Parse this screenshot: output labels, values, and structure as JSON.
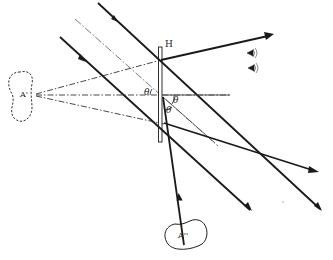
{
  "diagram": {
    "labels": {
      "hologram": "H",
      "virtual_image": "A'",
      "real_image": "A''",
      "angle_1": "θ",
      "angle_2": "θ",
      "angle_3": "θ"
    },
    "elements": [
      {
        "id": "hologram-plate",
        "type": "rect",
        "label": "H"
      },
      {
        "id": "virtual-image-blob",
        "type": "dashed-blob",
        "label": "A'"
      },
      {
        "id": "real-image-blob",
        "type": "solid-blob",
        "label": "A''"
      },
      {
        "id": "reconstruction-beam-upper",
        "type": "thick-arrow-line"
      },
      {
        "id": "reconstruction-beam-center",
        "type": "thin-dashdot-line"
      },
      {
        "id": "reconstruction-beam-lower",
        "type": "thick-arrow-line"
      },
      {
        "id": "diffracted-ray-to-eye",
        "type": "thick-arrow-line"
      },
      {
        "id": "diffracted-ray-to-real-image",
        "type": "thick-arrow-line"
      },
      {
        "id": "diffracted-ray-lower",
        "type": "thick-arrow-line"
      },
      {
        "id": "dashed-rays-from-virtual-image",
        "type": "dashed-lines",
        "count": 3
      },
      {
        "id": "observer-eyes",
        "type": "eye-icons",
        "count": 2
      }
    ],
    "colors": {
      "stroke": "#1a1a1a",
      "thin_stroke": "#555555",
      "background": "#ffffff"
    }
  }
}
